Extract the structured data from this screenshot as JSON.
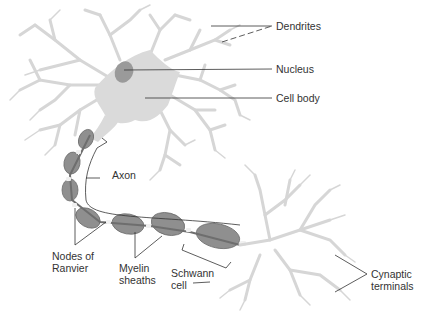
{
  "colors": {
    "background": "#ffffff",
    "dendrite": "#dcdcdc",
    "dendrite_stroke": "#cfcfcf",
    "cell_body": "#d9d9d9",
    "nucleus": "#9a9a9a",
    "myelin": "#8f8f8f",
    "myelin_dark": "#6e6e6e",
    "node": "#f0f0f0",
    "leader_line": "#333333",
    "text": "#333333"
  },
  "labels": {
    "dendrites": "Dendrites",
    "nucleus": "Nucleus",
    "cell_body": "Cell body",
    "axon": "Axon",
    "nodes_line1": "Nodes of",
    "nodes_line2": "Ranvier",
    "myelin_line1": "Myelin",
    "myelin_line2": "sheaths",
    "schwann_line1": "Schwann",
    "schwann_line2": "cell",
    "terminals_line1": "Cynaptic",
    "terminals_line2": "terminals"
  }
}
